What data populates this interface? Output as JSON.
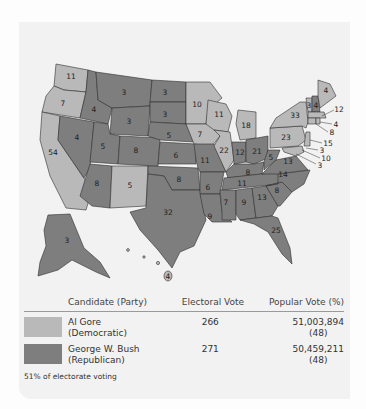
{
  "map": {
    "title": "",
    "colors": {
      "republican": "#7e7e7e",
      "democratic": "#b9b9b9",
      "background": "#f2f2f2"
    },
    "states": [
      {
        "abbr": "WA",
        "votes": "11",
        "party": "democratic"
      },
      {
        "abbr": "OR",
        "votes": "7",
        "party": "democratic"
      },
      {
        "abbr": "CA",
        "votes": "54",
        "party": "democratic"
      },
      {
        "abbr": "ID",
        "votes": "4",
        "party": "republican"
      },
      {
        "abbr": "NV",
        "votes": "4",
        "party": "republican"
      },
      {
        "abbr": "MT",
        "votes": "3",
        "party": "republican"
      },
      {
        "abbr": "WY",
        "votes": "3",
        "party": "republican"
      },
      {
        "abbr": "UT",
        "votes": "5",
        "party": "republican"
      },
      {
        "abbr": "AZ",
        "votes": "8",
        "party": "republican"
      },
      {
        "abbr": "CO",
        "votes": "8",
        "party": "republican"
      },
      {
        "abbr": "NM",
        "votes": "5",
        "party": "democratic"
      },
      {
        "abbr": "ND",
        "votes": "3",
        "party": "republican"
      },
      {
        "abbr": "SD",
        "votes": "3",
        "party": "republican"
      },
      {
        "abbr": "NE",
        "votes": "5",
        "party": "republican"
      },
      {
        "abbr": "KS",
        "votes": "6",
        "party": "republican"
      },
      {
        "abbr": "OK",
        "votes": "8",
        "party": "republican"
      },
      {
        "abbr": "TX",
        "votes": "32",
        "party": "republican"
      },
      {
        "abbr": "MN",
        "votes": "10",
        "party": "democratic"
      },
      {
        "abbr": "IA",
        "votes": "7",
        "party": "democratic"
      },
      {
        "abbr": "MO",
        "votes": "11",
        "party": "republican"
      },
      {
        "abbr": "AR",
        "votes": "6",
        "party": "republican"
      },
      {
        "abbr": "LA",
        "votes": "9",
        "party": "republican"
      },
      {
        "abbr": "WI",
        "votes": "11",
        "party": "democratic"
      },
      {
        "abbr": "IL",
        "votes": "22",
        "party": "democratic"
      },
      {
        "abbr": "MI",
        "votes": "18",
        "party": "democratic"
      },
      {
        "abbr": "IN",
        "votes": "12",
        "party": "republican"
      },
      {
        "abbr": "OH",
        "votes": "21",
        "party": "republican"
      },
      {
        "abbr": "KY",
        "votes": "8",
        "party": "republican"
      },
      {
        "abbr": "TN",
        "votes": "11",
        "party": "republican"
      },
      {
        "abbr": "MS",
        "votes": "7",
        "party": "republican"
      },
      {
        "abbr": "AL",
        "votes": "9",
        "party": "republican"
      },
      {
        "abbr": "GA",
        "votes": "13",
        "party": "republican"
      },
      {
        "abbr": "FL",
        "votes": "25",
        "party": "republican"
      },
      {
        "abbr": "SC",
        "votes": "8",
        "party": "republican"
      },
      {
        "abbr": "NC",
        "votes": "14",
        "party": "republican"
      },
      {
        "abbr": "VA",
        "votes": "13",
        "party": "republican"
      },
      {
        "abbr": "WV",
        "votes": "5",
        "party": "republican"
      },
      {
        "abbr": "PA",
        "votes": "23",
        "party": "democratic"
      },
      {
        "abbr": "NY",
        "votes": "33",
        "party": "democratic"
      },
      {
        "abbr": "VT",
        "votes": "3",
        "party": "democratic"
      },
      {
        "abbr": "NH",
        "votes": "4",
        "party": "republican"
      },
      {
        "abbr": "ME",
        "votes": "4",
        "party": "democratic"
      },
      {
        "abbr": "MA",
        "votes": "12",
        "party": "democratic"
      },
      {
        "abbr": "RI",
        "votes": "4",
        "party": "democratic"
      },
      {
        "abbr": "CT",
        "votes": "8",
        "party": "democratic"
      },
      {
        "abbr": "NJ",
        "votes": "15",
        "party": "democratic"
      },
      {
        "abbr": "DE",
        "votes": "3",
        "party": "democratic"
      },
      {
        "abbr": "MD",
        "votes": "10",
        "party": "democratic"
      },
      {
        "abbr": "DC",
        "votes": "3",
        "party": "democratic"
      },
      {
        "abbr": "AK",
        "votes": "3",
        "party": "republican"
      },
      {
        "abbr": "HI",
        "votes": "4",
        "party": "democratic"
      }
    ]
  },
  "legend": {
    "headers": {
      "candidate": "Candidate (Party)",
      "electoral": "Electoral Vote",
      "popular": "Popular Vote (%)"
    },
    "rows": [
      {
        "name": "Al Gore",
        "party": "(Democratic)",
        "electoral": "266",
        "popular": "51,003,894",
        "percent": "(48)",
        "color": "#b9b9b9"
      },
      {
        "name": "George W. Bush",
        "party": "(Republican)",
        "electoral": "271",
        "popular": "50,459,211",
        "percent": "(48)",
        "color": "#7e7e7e"
      }
    ],
    "footnote": "51% of electorate voting"
  }
}
